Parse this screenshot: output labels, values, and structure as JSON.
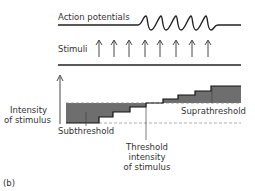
{
  "figure": {
    "panel_label": "(b)",
    "top": {
      "action_potentials_label": "Action potentials",
      "stimuli_label": "Stimuli",
      "stimulus_count": 8,
      "action_potential_count": 5
    },
    "bottom": {
      "y_axis_label_line1": "Intensity",
      "y_axis_label_line2": "of stimulus",
      "subthreshold_label": "Subthreshold",
      "suprathreshold_label": "Suprathreshold",
      "threshold_label_line1": "Threshold",
      "threshold_label_line2": "intensity",
      "threshold_label_line3": "of stimulus"
    },
    "colors": {
      "ink": "#222222",
      "shade": "#6e6e6e"
    }
  }
}
